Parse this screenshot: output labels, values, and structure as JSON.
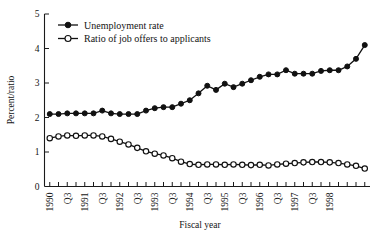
{
  "chart_data": {
    "type": "line",
    "title": "",
    "xlabel": "Fiscal year",
    "ylabel": "Percent/ratio",
    "ylim": [
      0,
      5
    ],
    "yticks": [
      0,
      1,
      2,
      3,
      4,
      5
    ],
    "ytick_labels": [
      "0",
      "1",
      "2",
      "3",
      "4",
      "5"
    ],
    "grid": false,
    "legend_position": "top-left",
    "x": [
      "1990 Q1",
      "1990 Q2",
      "1990 Q3",
      "1990 Q4",
      "1991 Q1",
      "1991 Q2",
      "1991 Q3",
      "1991 Q4",
      "1992 Q1",
      "1992 Q2",
      "1992 Q3",
      "1992 Q4",
      "1993 Q1",
      "1993 Q2",
      "1993 Q3",
      "1993 Q4",
      "1994 Q1",
      "1994 Q2",
      "1994 Q3",
      "1994 Q4",
      "1995 Q1",
      "1995 Q2",
      "1995 Q3",
      "1995 Q4",
      "1996 Q1",
      "1996 Q2",
      "1996 Q3",
      "1996 Q4",
      "1997 Q1",
      "1997 Q2",
      "1997 Q3",
      "1997 Q4",
      "1998 Q1",
      "1998 Q2"
    ],
    "xtick_labels": [
      "1990",
      "",
      "Q3",
      "",
      "1991",
      "",
      "Q3",
      "",
      "1992",
      "",
      "Q3",
      "",
      "1993",
      "",
      "Q3",
      "",
      "1994",
      "",
      "Q3",
      "",
      "1995",
      "",
      "Q3",
      "",
      "1996",
      "",
      "Q3",
      "",
      "1997",
      "",
      "Q3",
      "",
      "1998",
      ""
    ],
    "series": [
      {
        "name": "Unemployment rate",
        "marker": "filled-circle",
        "values": [
          2.1,
          2.1,
          2.12,
          2.12,
          2.12,
          2.12,
          2.2,
          2.12,
          2.1,
          2.1,
          2.1,
          2.2,
          2.27,
          2.3,
          2.3,
          2.4,
          2.5,
          2.7,
          2.92,
          2.8,
          2.98,
          2.88,
          2.98,
          3.08,
          3.18,
          3.25,
          3.25,
          3.37,
          3.27,
          3.27,
          3.27,
          3.35,
          3.37,
          3.37
        ]
      },
      {
        "name": "Ratio of job offers to applicants",
        "marker": "open-circle",
        "values": [
          1.4,
          1.45,
          1.48,
          1.47,
          1.48,
          1.48,
          1.45,
          1.38,
          1.3,
          1.22,
          1.12,
          1.02,
          0.95,
          0.9,
          0.82,
          0.72,
          0.65,
          0.63,
          0.64,
          0.64,
          0.63,
          0.64,
          0.63,
          0.62,
          0.63,
          0.61,
          0.64,
          0.66,
          0.68,
          0.7,
          0.71,
          0.71,
          0.7,
          0.68
        ]
      }
    ],
    "series_extra": {
      "Unemployment rate": [
        3.48,
        3.7,
        4.1
      ],
      "Ratio of job offers to applicants": [
        0.64,
        0.6,
        0.52
      ]
    },
    "legend": [
      {
        "label": "Unemployment rate",
        "marker": "filled-circle"
      },
      {
        "label": "Ratio of job offers to applicants",
        "marker": "open-circle"
      }
    ],
    "colors": {
      "series": "#111111",
      "axis": "#1a1a1a",
      "background": "#ffffff"
    }
  }
}
